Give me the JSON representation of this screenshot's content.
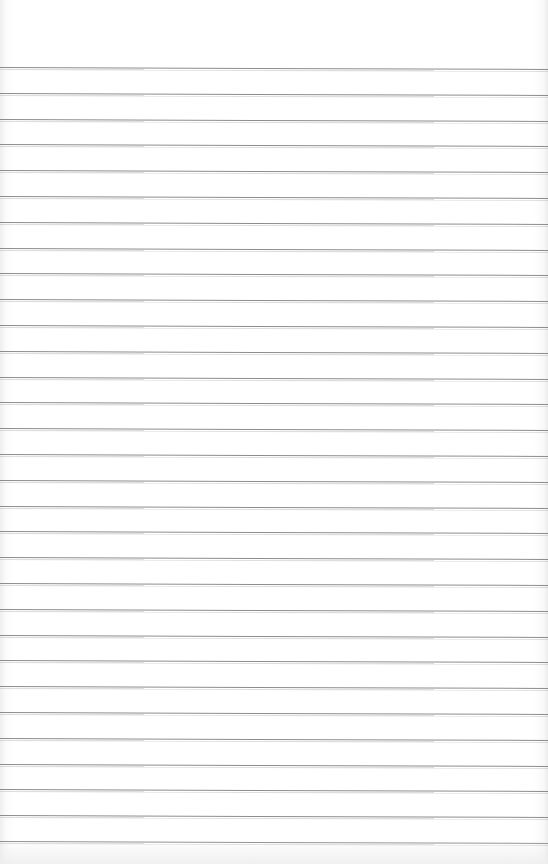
{
  "paper": {
    "type": "lined-paper",
    "background_color": "#ffffff",
    "rule_color": "#8c8c8c",
    "rule_count": 31,
    "first_rule_y": 67,
    "rule_spacing": 25.8
  }
}
